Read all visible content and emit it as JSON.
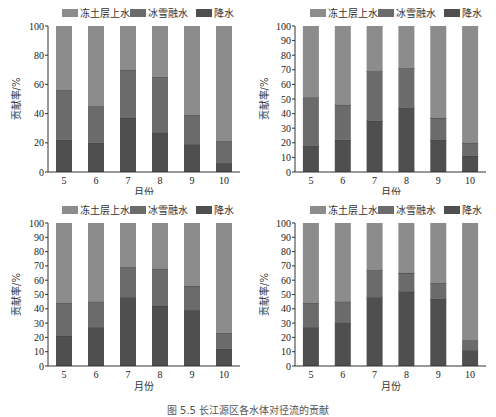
{
  "figure": {
    "caption": "图 5.5  长江源区各水体对径流的贡献"
  },
  "colors": {
    "permafrost_water": "#8c8c8c",
    "snowmelt": "#6b6b6b",
    "precipitation": "#4f4f4f"
  },
  "legend": [
    "冻土层上水",
    "冰雪融水",
    "降水"
  ],
  "chart_data": [
    {
      "panel": "(a)",
      "type": "bar",
      "stacked": true,
      "categories": [
        "5",
        "6",
        "7",
        "8",
        "9",
        "10"
      ],
      "xlabel": "月份",
      "ylabel": "贡献率/%",
      "ylim": [
        0,
        100
      ],
      "yticks": [
        0,
        20,
        40,
        60,
        80,
        100
      ],
      "legend_position": "top",
      "series": [
        {
          "name": "降水",
          "values": [
            22,
            20,
            37,
            27,
            19,
            6
          ]
        },
        {
          "name": "冰雪融水",
          "values": [
            34,
            25,
            33,
            38,
            20,
            15
          ]
        },
        {
          "name": "冻土层上水",
          "values": [
            44,
            55,
            30,
            35,
            61,
            79
          ]
        }
      ]
    },
    {
      "panel": "(b)",
      "type": "bar",
      "stacked": true,
      "categories": [
        "5",
        "6",
        "7",
        "8",
        "9",
        "10"
      ],
      "xlabel": "月份",
      "ylabel": "贡献率/%",
      "ylim": [
        0,
        100
      ],
      "yticks": [
        0,
        10,
        20,
        30,
        40,
        50,
        60,
        70,
        80,
        90,
        100
      ],
      "legend_position": "top",
      "series": [
        {
          "name": "降水",
          "values": [
            18,
            22,
            35,
            44,
            22,
            11
          ]
        },
        {
          "name": "冰雪融水",
          "values": [
            33,
            24,
            34,
            27,
            15,
            9
          ]
        },
        {
          "name": "冻土层上水",
          "values": [
            49,
            54,
            31,
            29,
            63,
            80
          ]
        }
      ]
    },
    {
      "panel": "(c)",
      "type": "bar",
      "stacked": true,
      "categories": [
        "5",
        "6",
        "7",
        "8",
        "9",
        "10"
      ],
      "xlabel": "月份",
      "ylabel": "贡献率/%",
      "ylim": [
        0,
        100
      ],
      "yticks": [
        0,
        10,
        20,
        30,
        40,
        50,
        60,
        70,
        80,
        90,
        100
      ],
      "legend_position": "top",
      "series": [
        {
          "name": "降水",
          "values": [
            21,
            27,
            48,
            42,
            39,
            12
          ]
        },
        {
          "name": "冰雪融水",
          "values": [
            23,
            18,
            21,
            26,
            17,
            11
          ]
        },
        {
          "name": "冻土层上水",
          "values": [
            56,
            55,
            31,
            32,
            44,
            77
          ]
        }
      ]
    },
    {
      "panel": "(d)",
      "type": "bar",
      "stacked": true,
      "categories": [
        "5",
        "6",
        "7",
        "8",
        "9",
        "10"
      ],
      "xlabel": "月份",
      "ylabel": "贡献率/%",
      "ylim": [
        0,
        100
      ],
      "yticks": [
        0,
        10,
        20,
        30,
        40,
        50,
        60,
        70,
        80,
        90,
        100
      ],
      "legend_position": "top",
      "series": [
        {
          "name": "降水",
          "values": [
            27,
            30,
            48,
            52,
            47,
            11
          ]
        },
        {
          "name": "冰雪融水",
          "values": [
            17,
            15,
            19,
            13,
            11,
            7
          ]
        },
        {
          "name": "冻土层上水",
          "values": [
            56,
            55,
            33,
            35,
            42,
            82
          ]
        }
      ]
    }
  ]
}
